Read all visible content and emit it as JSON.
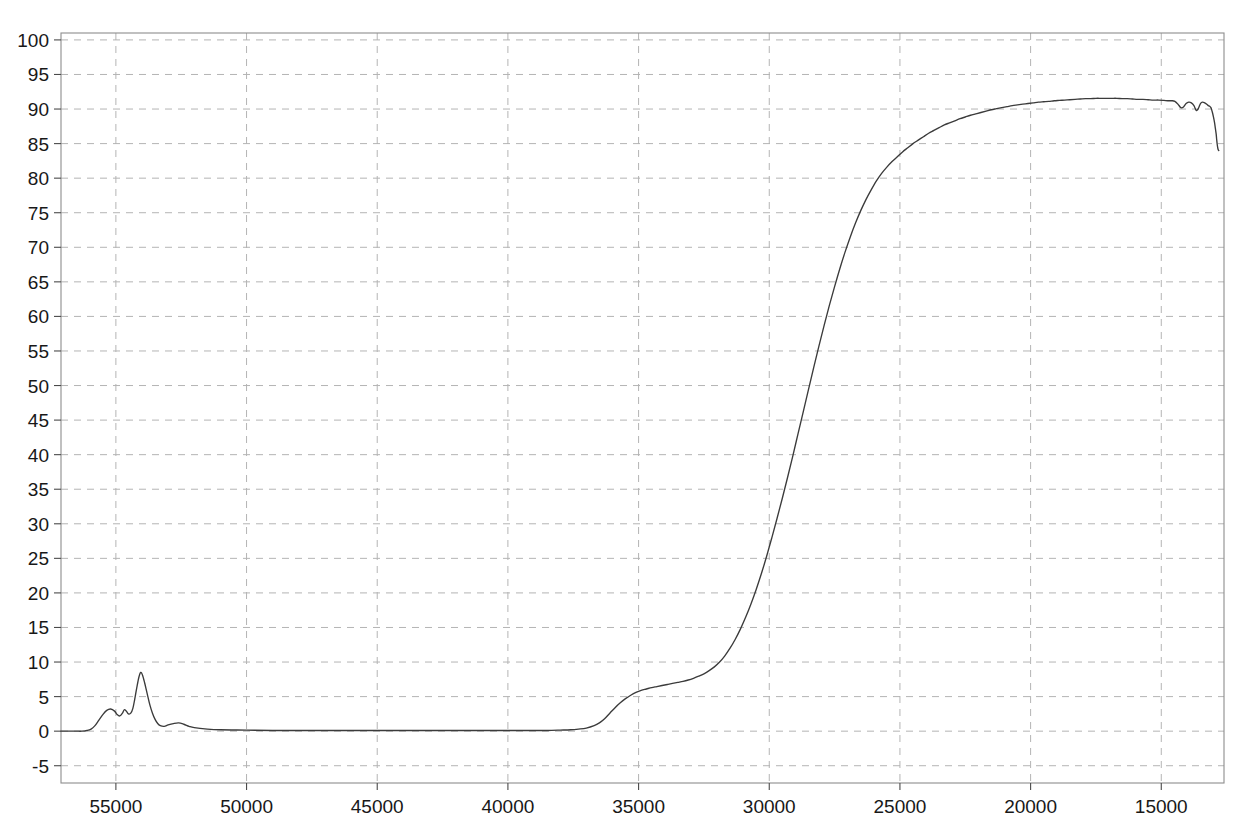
{
  "chart_data": {
    "type": "line",
    "title": "",
    "subtitle": "",
    "xlabel": "",
    "ylabel": "",
    "xlim": [
      57100,
      12600
    ],
    "ylim": [
      -7.5,
      101
    ],
    "x_reversed": true,
    "grid": true,
    "legend": false,
    "legend_position": "none",
    "xticks": [
      55000,
      50000,
      45000,
      40000,
      35000,
      30000,
      25000,
      20000,
      15000
    ],
    "xtick_labels": [
      "55000",
      "50000",
      "45000",
      "40000",
      "35000",
      "30000",
      "25000",
      "20000",
      "15000"
    ],
    "yticks": [
      -5,
      0,
      5,
      10,
      15,
      20,
      25,
      30,
      35,
      40,
      45,
      50,
      55,
      60,
      65,
      70,
      75,
      80,
      85,
      90,
      95,
      100
    ],
    "ytick_labels": [
      "-5",
      "0",
      "5",
      "10",
      "15",
      "20",
      "25",
      "30",
      "35",
      "40",
      "45",
      "50",
      "55",
      "60",
      "65",
      "70",
      "75",
      "80",
      "85",
      "90",
      "95",
      "100"
    ],
    "series": [
      {
        "name": "transmittance",
        "color": "#3b3b3b",
        "x": [
          57100,
          56900,
          56700,
          56500,
          56300,
          56100,
          55950,
          55800,
          55650,
          55500,
          55350,
          55200,
          55050,
          54950,
          54850,
          54750,
          54680,
          54600,
          54520,
          54430,
          54350,
          54280,
          54200,
          54120,
          54050,
          53980,
          53900,
          53800,
          53700,
          53600,
          53500,
          53400,
          53300,
          53150,
          53000,
          52800,
          52600,
          52400,
          52200,
          52000,
          51500,
          51000,
          50000,
          49000,
          48000,
          47000,
          46000,
          45000,
          44000,
          43000,
          42000,
          41000,
          40000,
          39500,
          39000,
          38500,
          38000,
          37600,
          37300,
          37000,
          36700,
          36500,
          36300,
          36100,
          35900,
          35700,
          35500,
          35300,
          35100,
          34900,
          34700,
          34500,
          34300,
          34100,
          33900,
          33700,
          33500,
          33300,
          33100,
          32900,
          32700,
          32500,
          32300,
          32100,
          31900,
          31700,
          31500,
          31300,
          31100,
          30900,
          30700,
          30500,
          30300,
          30100,
          29900,
          29700,
          29500,
          29300,
          29100,
          28900,
          28700,
          28500,
          28300,
          28100,
          27900,
          27700,
          27500,
          27300,
          27100,
          26900,
          26700,
          26500,
          26300,
          26100,
          25900,
          25700,
          25500,
          25300,
          25100,
          24900,
          24700,
          24500,
          24300,
          24100,
          23900,
          23700,
          23500,
          23300,
          23100,
          22900,
          22700,
          22500,
          22300,
          22100,
          21900,
          21700,
          21500,
          21300,
          21100,
          20900,
          20700,
          20500,
          20300,
          20100,
          19900,
          19700,
          19500,
          19300,
          19100,
          18900,
          18700,
          18500,
          18300,
          18100,
          17900,
          17700,
          17500,
          17300,
          17100,
          16900,
          16700,
          16500,
          16300,
          16100,
          15900,
          15700,
          15500,
          15300,
          15100,
          14900,
          14750,
          14600,
          14480,
          14360,
          14250,
          14150,
          14050,
          13950,
          13850,
          13750,
          13660,
          13580,
          13500,
          13420,
          13340,
          13260,
          13200,
          13150,
          13100,
          13050,
          13000,
          12960,
          12930,
          12900,
          12880,
          12860,
          12840,
          12820,
          12800
        ],
        "y": [
          0.0,
          0.0,
          0.0,
          0.0,
          0.0,
          0.1,
          0.3,
          0.8,
          1.6,
          2.4,
          3.0,
          3.2,
          2.9,
          2.4,
          2.2,
          2.6,
          3.1,
          2.9,
          2.5,
          2.6,
          3.3,
          4.6,
          6.3,
          7.8,
          8.5,
          8.1,
          7.0,
          5.4,
          3.8,
          2.6,
          1.7,
          1.1,
          0.8,
          0.7,
          0.9,
          1.1,
          1.2,
          1.0,
          0.7,
          0.5,
          0.3,
          0.2,
          0.15,
          0.1,
          0.1,
          0.1,
          0.1,
          0.1,
          0.1,
          0.1,
          0.1,
          0.1,
          0.1,
          0.1,
          0.1,
          0.1,
          0.15,
          0.2,
          0.3,
          0.45,
          0.8,
          1.2,
          1.8,
          2.6,
          3.4,
          4.1,
          4.7,
          5.2,
          5.6,
          5.9,
          6.1,
          6.3,
          6.45,
          6.6,
          6.75,
          6.9,
          7.05,
          7.2,
          7.4,
          7.65,
          7.95,
          8.3,
          8.75,
          9.3,
          10.0,
          10.9,
          12.0,
          13.3,
          14.8,
          16.5,
          18.4,
          20.5,
          22.8,
          25.3,
          28.0,
          30.8,
          33.7,
          36.7,
          39.8,
          43.0,
          46.2,
          49.4,
          52.6,
          55.7,
          58.7,
          61.6,
          64.3,
          66.9,
          69.3,
          71.5,
          73.5,
          75.3,
          76.9,
          78.3,
          79.6,
          80.7,
          81.6,
          82.4,
          83.1,
          83.8,
          84.4,
          85.0,
          85.5,
          86.0,
          86.5,
          86.9,
          87.3,
          87.7,
          88.0,
          88.3,
          88.6,
          88.85,
          89.1,
          89.3,
          89.5,
          89.7,
          89.9,
          90.05,
          90.2,
          90.35,
          90.5,
          90.6,
          90.7,
          90.8,
          90.9,
          91.0,
          91.05,
          91.1,
          91.2,
          91.25,
          91.3,
          91.35,
          91.4,
          91.45,
          91.5,
          91.5,
          91.55,
          91.55,
          91.55,
          91.55,
          91.55,
          91.5,
          91.5,
          91.45,
          91.4,
          91.4,
          91.35,
          91.3,
          91.3,
          91.25,
          91.2,
          91.2,
          91.1,
          90.7,
          90.2,
          90.3,
          90.8,
          91.0,
          90.9,
          90.5,
          89.8,
          90.1,
          90.8,
          91.0,
          90.9,
          90.7,
          90.5,
          90.4,
          90.2,
          89.6,
          88.8,
          88.0,
          87.2,
          86.4,
          85.6,
          84.9,
          84.4,
          84.1,
          84.0
        ]
      }
    ],
    "annotations": {
      "noise_peak_value": 8.5,
      "noise_peak_x": 54050,
      "shoulder_value": 7.0,
      "shoulder_x": 34500,
      "plateau_value": 91.5,
      "baseline_value": 0,
      "final_value": 84.0
    }
  },
  "axes": {
    "plot_left_px": 61,
    "plot_right_px": 1224,
    "plot_top_px": 33,
    "plot_bottom_px": 783
  }
}
